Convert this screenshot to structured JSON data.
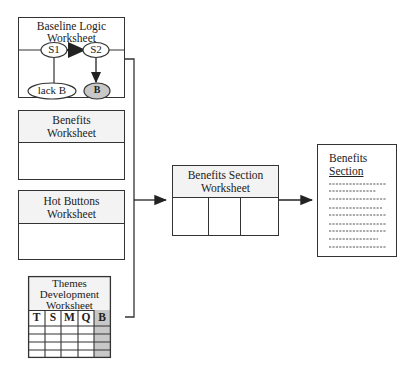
{
  "baseline_logic": {
    "title_line1": "Baseline Logic",
    "title_line2": "Worksheet",
    "nodes": {
      "s1": "S1",
      "s2": "S2",
      "lack_b": "lack B",
      "b": "B"
    }
  },
  "benefits_worksheet": {
    "title_line1": "Benefits",
    "title_line2": "Worksheet"
  },
  "hot_buttons_worksheet": {
    "title_line1": "Hot Buttons",
    "title_line2": "Worksheet"
  },
  "themes_development_worksheet": {
    "title_line1": "Themes",
    "title_line2": "Development",
    "title_line3": "Worksheet",
    "columns": [
      "T",
      "S",
      "M",
      "Q",
      "B"
    ],
    "empty_rows": 4,
    "highlight_column": "B"
  },
  "benefits_section_worksheet": {
    "title_line1": "Benefits Section",
    "title_line2": "Worksheet",
    "column_count": 3
  },
  "benefits_section_document": {
    "title_line1": "Benefits",
    "title_line2": "Section",
    "placeholder_lines": 9
  },
  "colors": {
    "line": "#333333",
    "shaded_fill": "#c8c8c8",
    "header_fill": "#f3f3f3"
  }
}
